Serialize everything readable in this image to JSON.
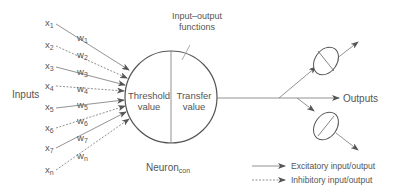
{
  "diagram": {
    "type": "artificial-neuron",
    "inputs_label": "Inputs",
    "outputs_label": "Outputs",
    "neuron_label": "Neuron",
    "neuron_subscript": "con",
    "io_functions_label_line1": "Input–output",
    "io_functions_label_line2": "functions",
    "threshold_line1": "Threshold",
    "threshold_line2": "value",
    "transfer_line1": "Transfer",
    "transfer_line2": "value",
    "inputs": [
      {
        "x": "x",
        "x_sub": "1",
        "w": "w",
        "w_sub": "1",
        "style": "excitatory"
      },
      {
        "x": "x",
        "x_sub": "2",
        "w": "w",
        "w_sub": "2",
        "style": "inhibitory"
      },
      {
        "x": "x",
        "x_sub": "3",
        "w": "w",
        "w_sub": "3",
        "style": "excitatory"
      },
      {
        "x": "x",
        "x_sub": "4",
        "w": "w",
        "w_sub": "4",
        "style": "inhibitory"
      },
      {
        "x": "x",
        "x_sub": "5",
        "w": "w",
        "w_sub": "5",
        "style": "excitatory"
      },
      {
        "x": "x",
        "x_sub": "6",
        "w": "w",
        "w_sub": "6",
        "style": "inhibitory"
      },
      {
        "x": "x",
        "x_sub": "7",
        "w": "w",
        "w_sub": "7",
        "style": "excitatory"
      },
      {
        "x": "x",
        "x_sub": "n",
        "w": "w",
        "w_sub": "n",
        "style": "inhibitory"
      }
    ],
    "legend": [
      {
        "label": "Excitatory input/output",
        "style": "solid"
      },
      {
        "label": "Inhibitory input/output",
        "style": "dashed"
      }
    ],
    "colors": {
      "line": "#666666",
      "text": "#555555",
      "background": "#ffffff"
    }
  }
}
